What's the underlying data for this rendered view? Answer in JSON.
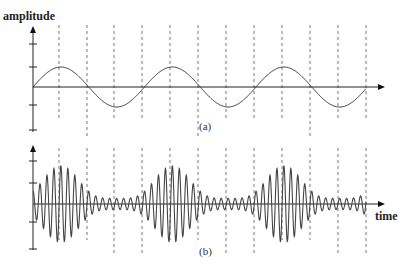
{
  "labels": {
    "y_axis": "amplitude",
    "x_axis": "time",
    "panel_a": "(a)",
    "panel_b": "(b)"
  },
  "colors": {
    "line": "#333333",
    "axis": "#222222",
    "dash": "#555555"
  },
  "chart_data": [
    {
      "type": "line",
      "panel": "(a)",
      "title": "(a)",
      "description": "Low-frequency sine wave (modulating signal)",
      "ylabel": "amplitude",
      "xlabel": "",
      "cycles_shown": 3,
      "amplitude_ticks": 2,
      "ylim": [
        -2.5,
        2.5
      ],
      "amplitude": 1,
      "phase": "starts at zero, rising"
    },
    {
      "type": "line",
      "panel": "(b)",
      "title": "(b)",
      "description": "High-frequency carrier whose amplitude follows the envelope of (a): large bursts at peaks of (a), small ripple at troughs",
      "ylabel": "",
      "xlabel": "time",
      "bursts": 3,
      "max_amplitude": 1.7,
      "min_amplitude": 0.25,
      "carrier_cycles_per_modulation_period": 16
    }
  ],
  "geometry": {
    "x0": 33,
    "x_end": 385,
    "period_px": 111.5,
    "dashed_x": [
      59,
      87,
      114,
      142,
      170,
      198,
      226,
      254,
      282,
      310,
      338,
      366
    ],
    "panel_a": {
      "zero_y": 87,
      "amp_px": 20,
      "axis_top": 26,
      "axis_bottom": 132,
      "ticks": [
        44,
        67,
        105,
        130
      ],
      "dash_top": 25,
      "dash_bottom": 118,
      "dash_long_bottom": 138,
      "x_end": 366
    },
    "panel_b": {
      "zero_y": 204,
      "amp_px": 22.5,
      "axis_top": 145,
      "axis_bottom": 250,
      "ticks": [
        161,
        183,
        222,
        249
      ],
      "dash_top": 148,
      "dash_bottom": 240,
      "dash_long_bottom": 255,
      "x_end": 366
    }
  }
}
